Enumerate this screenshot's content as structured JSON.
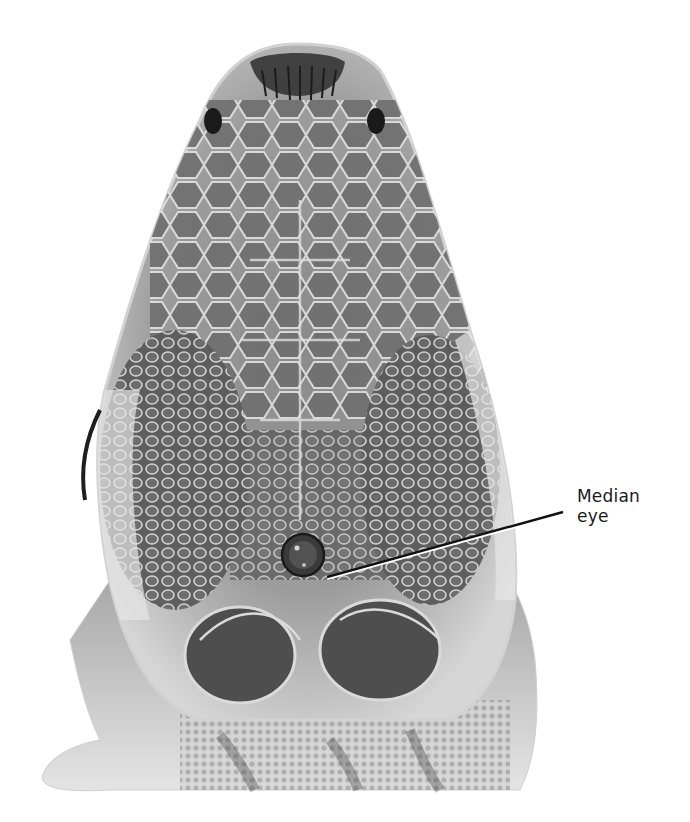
{
  "figure": {
    "annotation": {
      "line1": "Median",
      "line2": "eye"
    },
    "colors": {
      "background": "#ffffff",
      "scale_dark": "#4a4a4a",
      "scale_mid": "#7d7d7d",
      "scale_light": "#c8c8c8",
      "leader_line": "#111111"
    }
  }
}
